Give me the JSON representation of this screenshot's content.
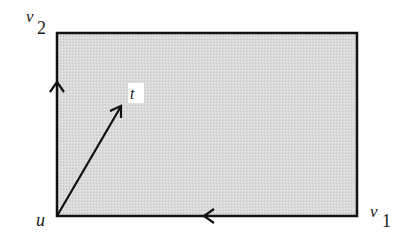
{
  "diagram": {
    "region_fill": "#d9d9d9",
    "stroke_color": "#111111",
    "t_label_bg": "#ffffff",
    "vertices": {
      "u": {
        "name": "u",
        "subscript": ""
      },
      "v1": {
        "name": "v",
        "subscript": "1"
      },
      "v2": {
        "name": "v",
        "subscript": "2"
      }
    },
    "interior_point": {
      "name": "t"
    },
    "edges": [
      {
        "from": "u",
        "to": "v2",
        "direction": "up",
        "arrow": true
      },
      {
        "from": "v1",
        "to": "u",
        "direction": "left",
        "arrow": true
      },
      {
        "from": "u",
        "to": "t",
        "direction": "up-right",
        "arrow": true
      }
    ]
  }
}
